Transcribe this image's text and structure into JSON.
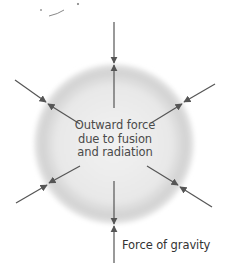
{
  "diagram": {
    "star": {
      "center_x": 114,
      "center_y": 144,
      "radius": 80,
      "fill_color": "#e6e6e6",
      "edge_color": "#c8c8c8"
    },
    "labels": {
      "outward_force": [
        "Outward force",
        "due to fusion",
        "and radiation"
      ],
      "gravity": "Force of gravity"
    },
    "arrow_color": "#555555",
    "arrows": [
      {
        "name": "top",
        "outer": [
          114,
          22
        ],
        "tip": [
          114,
          64
        ],
        "inner": [
          114,
          108
        ]
      },
      {
        "name": "bottom",
        "outer": [
          114,
          263
        ],
        "tip": [
          114,
          225
        ],
        "inner": [
          114,
          180
        ]
      },
      {
        "name": "upper-left",
        "outer": [
          15,
          80
        ],
        "tip": [
          47,
          103
        ],
        "inner": [
          80,
          124
        ]
      },
      {
        "name": "upper-right",
        "outer": [
          215,
          84
        ],
        "tip": [
          183,
          103
        ],
        "inner": [
          151,
          123
        ]
      },
      {
        "name": "lower-left",
        "outer": [
          16,
          203
        ],
        "tip": [
          48,
          184
        ],
        "inner": [
          80,
          166
        ]
      },
      {
        "name": "lower-right",
        "outer": [
          212,
          207
        ],
        "tip": [
          179,
          186
        ],
        "inner": [
          147,
          166
        ]
      }
    ]
  }
}
